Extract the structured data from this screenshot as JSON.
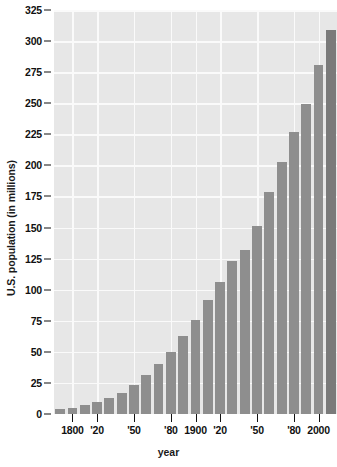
{
  "chart_data": {
    "type": "bar",
    "title": "",
    "xlabel": "year",
    "ylabel": "U.S. population (in millions)",
    "ylim": [
      0,
      325
    ],
    "ytick_step": 25,
    "yticks": [
      "0",
      "25",
      "50",
      "75",
      "100",
      "125",
      "150",
      "175",
      "200",
      "225",
      "250",
      "275",
      "300",
      "325"
    ],
    "ytick_values": [
      0,
      25,
      50,
      75,
      100,
      125,
      150,
      175,
      200,
      225,
      250,
      275,
      300,
      325
    ],
    "grid": true,
    "legend": "none",
    "categories": [
      1790,
      1800,
      1810,
      1820,
      1830,
      1840,
      1850,
      1860,
      1870,
      1880,
      1890,
      1900,
      1910,
      1920,
      1930,
      1940,
      1950,
      1960,
      1970,
      1980,
      1990,
      2000,
      2010
    ],
    "values": [
      4,
      5,
      7,
      10,
      13,
      17,
      23,
      31,
      40,
      50,
      63,
      76,
      92,
      106,
      123,
      132,
      151,
      179,
      203,
      227,
      249,
      281,
      309
    ],
    "xtick_labels": [
      "1800",
      "'20",
      "'50",
      "'80",
      "1900",
      "'20",
      "'50",
      "'80",
      "2000"
    ],
    "xtick_categories": [
      1800,
      1820,
      1850,
      1880,
      1900,
      1920,
      1950,
      1980,
      2000
    ],
    "bar_color": "#8e8e8e",
    "last_bar_color": "#7a7a7a",
    "plot_background": "#e7e7e7",
    "gridline_color": "#fafafa"
  }
}
